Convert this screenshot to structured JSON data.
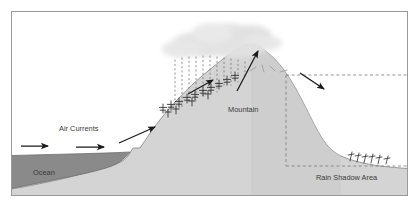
{
  "figure": {
    "background_color": "#ffffff",
    "frame_color": "#9a9a9a"
  },
  "labels": {
    "ocean": "Ocean",
    "air_currents": "Air Currents",
    "mountain": "Mountain",
    "rain_shadow_area": "Rain Shadow Area"
  },
  "colors": {
    "land": "#d4d4d4",
    "land_outline": "#8e8e8e",
    "ocean": "#8a8a8a",
    "ocean_outline": "#6f6f6f",
    "cloud": "#e2e2e2",
    "rain": "#6e6e6e",
    "arrow": "#1a1a1a",
    "dashed_box": "#7a7a7a",
    "vegetation": "#2b2b2b",
    "text": "#3a3a3a",
    "frame": "#9a9a9a",
    "snow_marks": "#b0b0b0"
  },
  "elements": {
    "ocean_arrows": [
      {
        "name": "ocean-arrow-1",
        "x1": 21,
        "y1": 146,
        "x2": 48,
        "y2": 146
      },
      {
        "name": "ocean-arrow-2",
        "x1": 76,
        "y1": 147,
        "x2": 104,
        "y2": 147
      }
    ],
    "slope_arrow": {
      "name": "windward-slope-arrow",
      "x1": 119,
      "y1": 143,
      "x2": 155,
      "y2": 127
    },
    "mid_slope_arrow": {
      "name": "mid-slope-arrow",
      "x1": 188,
      "y1": 94,
      "x2": 213,
      "y2": 80
    },
    "updraft_arrow": {
      "name": "updraft-arrow",
      "x1": 237,
      "y1": 91,
      "x2": 258,
      "y2": 51
    },
    "descent_arrow": {
      "name": "leeward-descent-arrow",
      "x1": 300,
      "y1": 73,
      "x2": 324,
      "y2": 89
    },
    "rain_line_count": 11,
    "windward_tree_count": 14,
    "leeward_shrub_count": 6,
    "cloud_segments": 7
  },
  "annotations": {
    "rain_shadow_box": {
      "left": 286,
      "top": 75,
      "right": 404,
      "bottom": 166,
      "style": "dashed"
    }
  }
}
